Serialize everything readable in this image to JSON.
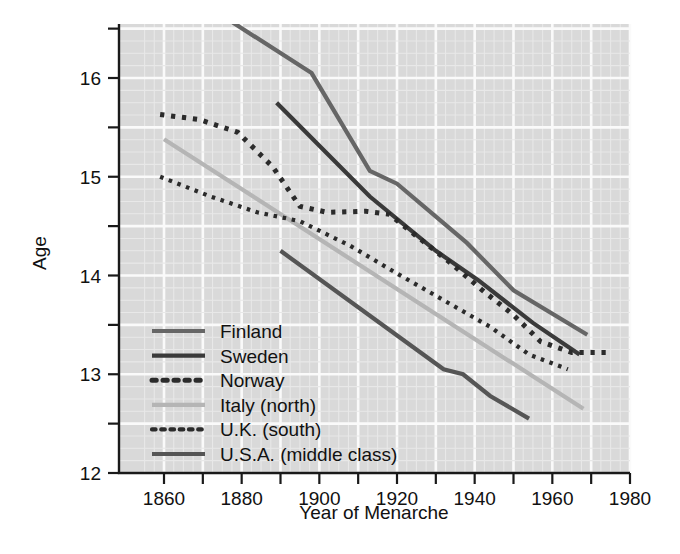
{
  "chart_data": {
    "type": "line",
    "title": "",
    "xlabel": "Year of Menarche",
    "ylabel": "Age",
    "xlim": [
      1852,
      1984
    ],
    "ylim": [
      12,
      16.6
    ],
    "grid": true,
    "legend_position": "inside-lower-left",
    "x_ticks_major": [
      1860,
      1880,
      1900,
      1920,
      1940,
      1960,
      1980
    ],
    "x_tick_labels": [
      "1860",
      "1880",
      "1900",
      "1920",
      "1940",
      "1960",
      "1980"
    ],
    "x_ticks_minor": [
      1870,
      1890,
      1910,
      1930,
      1950,
      1970
    ],
    "y_ticks_major": [
      12,
      13,
      14,
      15,
      16
    ],
    "y_tick_labels": [
      "12",
      "13",
      "14",
      "15",
      "16"
    ],
    "y_ticks_minor": [
      12.5,
      13.5,
      14.5,
      15.5,
      16.5
    ],
    "series": [
      {
        "name": "Finland",
        "color": "#666666",
        "style": "solid",
        "width": 4.2,
        "points": [
          [
            1877,
            16.58
          ],
          [
            1898,
            16.05
          ],
          [
            1913,
            15.06
          ],
          [
            1920,
            14.93
          ],
          [
            1938,
            14.33
          ],
          [
            1950,
            13.85
          ],
          [
            1969,
            13.4
          ]
        ]
      },
      {
        "name": "Sweden",
        "color": "#3a3a3a",
        "style": "solid",
        "width": 4.2,
        "points": [
          [
            1889,
            15.75
          ],
          [
            1913,
            14.8
          ],
          [
            1930,
            14.25
          ],
          [
            1941,
            13.95
          ],
          [
            1955,
            13.52
          ],
          [
            1967,
            13.2
          ]
        ]
      },
      {
        "name": "Norway",
        "color": "#2b2b2b",
        "style": "dotted",
        "width": 5.0,
        "points": [
          [
            1859,
            15.63
          ],
          [
            1869,
            15.58
          ],
          [
            1879,
            15.45
          ],
          [
            1888,
            15.1
          ],
          [
            1895,
            14.7
          ],
          [
            1902,
            14.64
          ],
          [
            1912,
            14.65
          ],
          [
            1918,
            14.62
          ],
          [
            1925,
            14.4
          ],
          [
            1934,
            14.12
          ],
          [
            1942,
            13.85
          ],
          [
            1950,
            13.6
          ],
          [
            1957,
            13.33
          ],
          [
            1965,
            13.22
          ],
          [
            1975,
            13.22
          ]
        ]
      },
      {
        "name": "Italy (north)",
        "color": "#b5b5b5",
        "style": "solid",
        "width": 4.2,
        "points": [
          [
            1860,
            15.38
          ],
          [
            1968,
            12.65
          ]
        ]
      },
      {
        "name": "U.K. (south)",
        "color": "#2b2b2b",
        "style": "dotted",
        "width": 4.2,
        "points": [
          [
            1859,
            15.0
          ],
          [
            1872,
            14.8
          ],
          [
            1884,
            14.64
          ],
          [
            1895,
            14.55
          ],
          [
            1908,
            14.3
          ],
          [
            1920,
            14.02
          ],
          [
            1932,
            13.75
          ],
          [
            1944,
            13.48
          ],
          [
            1954,
            13.2
          ],
          [
            1964,
            13.05
          ]
        ]
      },
      {
        "name": "U.S.A. (middle class)",
        "color": "#555555",
        "style": "solid",
        "width": 4.2,
        "points": [
          [
            1890,
            14.25
          ],
          [
            1932,
            13.05
          ],
          [
            1937,
            13.0
          ],
          [
            1944,
            12.78
          ],
          [
            1954,
            12.55
          ]
        ]
      }
    ]
  },
  "axes": {
    "x_title": "Year of Menarche",
    "y_title": "Age"
  },
  "legend": {
    "entries": [
      {
        "label": "Finland"
      },
      {
        "label": "Sweden"
      },
      {
        "label": "Norway"
      },
      {
        "label": "Italy (north)"
      },
      {
        "label": "U.K. (south)"
      },
      {
        "label": "U.S.A. (middle class)"
      }
    ]
  }
}
